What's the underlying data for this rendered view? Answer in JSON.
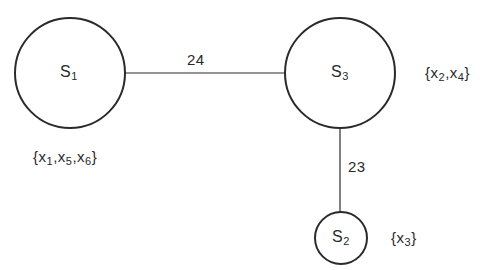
{
  "diagram": {
    "type": "tree",
    "nodes": [
      {
        "id": "S1",
        "name": "S",
        "subscript": "1",
        "members": "{x1,x5,x6}",
        "members_parts": [
          {
            "t": "{x",
            "s": "1"
          },
          {
            "t": ",x",
            "s": "5"
          },
          {
            "t": ",x",
            "s": "6"
          },
          {
            "t": "}",
            "s": ""
          }
        ],
        "cx": 70,
        "cy": 73,
        "r": 55
      },
      {
        "id": "S3",
        "name": "S",
        "subscript": "3",
        "members": "{x2,x4}",
        "members_parts": [
          {
            "t": "{x",
            "s": "2"
          },
          {
            "t": ",x",
            "s": "4"
          },
          {
            "t": "}",
            "s": ""
          }
        ],
        "cx": 340,
        "cy": 73,
        "r": 55
      },
      {
        "id": "S2",
        "name": "S",
        "subscript": "2",
        "members": "{x3}",
        "members_parts": [
          {
            "t": "{x",
            "s": "3"
          },
          {
            "t": "}",
            "s": ""
          }
        ],
        "cx": 341,
        "cy": 238,
        "r": 26
      }
    ],
    "edges": [
      {
        "from": "S1",
        "to": "S3",
        "weight": "24"
      },
      {
        "from": "S3",
        "to": "S2",
        "weight": "23"
      }
    ]
  },
  "colors": {
    "stroke": "#2a2a2a",
    "background": "#ffffff"
  }
}
